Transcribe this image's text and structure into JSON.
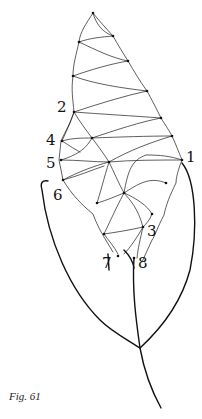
{
  "figure": {
    "caption": "Fig. 61",
    "labels": [
      {
        "id": "1",
        "text": "1"
      },
      {
        "id": "2",
        "text": "2"
      },
      {
        "id": "3",
        "text": "3"
      },
      {
        "id": "4",
        "text": "4"
      },
      {
        "id": "5",
        "text": "5"
      },
      {
        "id": "6",
        "text": "6"
      },
      {
        "id": "7",
        "text": "7"
      },
      {
        "id": "8",
        "text": "8"
      }
    ]
  }
}
